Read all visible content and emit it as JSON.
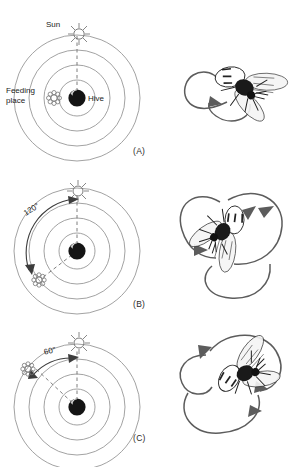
{
  "figure": {
    "caption_letters": {
      "a": "(A)",
      "b": "(B)",
      "c": "(C)"
    },
    "colors": {
      "background": "#ffffff",
      "ink": "#2b2b2b",
      "circle_stroke": "#8a8a8a",
      "dashed_stroke": "#6f6f6f",
      "arrow_stroke": "#5c5c5c",
      "hive_dark": "#1a1a1a",
      "bee_body": "#222222"
    }
  },
  "panels": [
    {
      "id": "A",
      "letter": "(A)",
      "labels": {
        "sun": "Sun",
        "feeding_place": "Feeding\nplace",
        "hive": "Hive",
        "angle": ""
      },
      "geometry": {
        "sun_bearing_deg": 0,
        "feeding_bearing_deg": 270,
        "angle_between_deg": 0,
        "rings": 4
      },
      "dance": {
        "bee_heading_deg": 45,
        "arrow_count": 1,
        "description": "figure-eight loop, waggle run straight up"
      }
    },
    {
      "id": "B",
      "letter": "(B)",
      "labels": {
        "sun": "",
        "feeding_place": "",
        "hive": "",
        "angle": "120°"
      },
      "geometry": {
        "sun_bearing_deg": 0,
        "feeding_bearing_deg": 240,
        "angle_between_deg": 120,
        "rings": 4
      },
      "dance": {
        "bee_heading_deg": 210,
        "arrow_count": 3,
        "description": "figure-eight loop, waggle run 120 degrees from vertical"
      }
    },
    {
      "id": "C",
      "letter": "(C)",
      "labels": {
        "sun": "",
        "feeding_place": "",
        "hive": "",
        "angle": "60°"
      },
      "geometry": {
        "sun_bearing_deg": 0,
        "feeding_bearing_deg": 300,
        "angle_between_deg": 60,
        "rings": 4
      },
      "dance": {
        "bee_heading_deg": 300,
        "arrow_count": 3,
        "description": "figure-eight loop, waggle run 60 degrees from vertical"
      }
    }
  ],
  "icons": {
    "sun": "sun-starburst-icon",
    "hive": "hive-sphere-icon",
    "flower": "flower-feeding-icon",
    "bee": "bee-icon"
  }
}
